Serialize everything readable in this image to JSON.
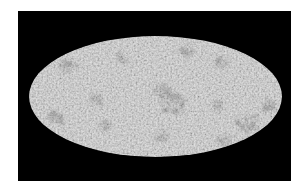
{
  "image": {
    "description": "Full-sky map in Mollweide projection, grayscale speckled noise on black background",
    "projection": "mollweide",
    "background_color": "#000000",
    "page_color": "#ffffff",
    "map_base_color": "#cdcdcd",
    "frame": {
      "x": 18,
      "y": 11,
      "width": 273,
      "height": 170
    },
    "ellipse": {
      "cx": 137.5,
      "cy": 85.5,
      "rx": 126.5,
      "ry": 60.5
    },
    "dark_regions": [
      {
        "name": "center-cluster",
        "cx": 154,
        "cy": 91,
        "r": 14,
        "opacity": 0.55
      },
      {
        "name": "center-upper",
        "cx": 142,
        "cy": 79,
        "r": 9,
        "opacity": 0.4
      },
      {
        "name": "right-lower-cluster",
        "cx": 230,
        "cy": 111,
        "r": 12,
        "opacity": 0.5
      },
      {
        "name": "right-edge-cluster",
        "cx": 250,
        "cy": 94,
        "r": 7,
        "opacity": 0.5
      },
      {
        "name": "top-right-a",
        "cx": 170,
        "cy": 39,
        "r": 7,
        "opacity": 0.4
      },
      {
        "name": "top-right-b",
        "cx": 204,
        "cy": 51,
        "r": 7,
        "opacity": 0.4
      },
      {
        "name": "left-upper",
        "cx": 50,
        "cy": 57,
        "r": 9,
        "opacity": 0.4
      },
      {
        "name": "left-lower",
        "cx": 37,
        "cy": 107,
        "r": 8,
        "opacity": 0.45
      },
      {
        "name": "left-middle",
        "cx": 77,
        "cy": 89,
        "r": 7,
        "opacity": 0.35
      },
      {
        "name": "left-bottom",
        "cx": 87,
        "cy": 114,
        "r": 6,
        "opacity": 0.35
      },
      {
        "name": "bottom-center",
        "cx": 144,
        "cy": 124,
        "r": 7,
        "opacity": 0.35
      },
      {
        "name": "bottom-right",
        "cx": 207,
        "cy": 129,
        "r": 7,
        "opacity": 0.35
      },
      {
        "name": "upper-left-mid",
        "cx": 105,
        "cy": 48,
        "r": 6,
        "opacity": 0.3
      },
      {
        "name": "center-right",
        "cx": 200,
        "cy": 95,
        "r": 6,
        "opacity": 0.3
      }
    ]
  }
}
